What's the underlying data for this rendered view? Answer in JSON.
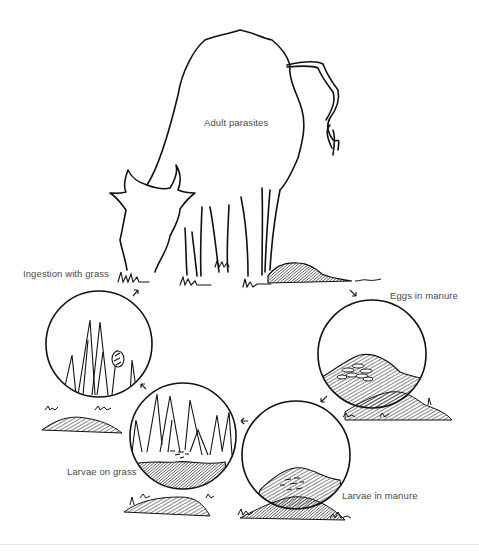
{
  "diagram": {
    "labels": {
      "adult": "Adult parasites",
      "ingestion": "Ingestion with grass",
      "eggs": "Eggs in manure",
      "larvae_manure": "Larvae in manure",
      "larvae_grass": "Larvae on grass"
    },
    "stages": [
      {
        "id": "adult",
        "label": "Adult parasites",
        "location": "inside cow"
      },
      {
        "id": "eggs",
        "label": "Eggs in manure",
        "location": "manure pat"
      },
      {
        "id": "larvae_manure",
        "label": "Larvae in manure",
        "location": "manure pat"
      },
      {
        "id": "larvae_grass",
        "label": "Larvae on grass",
        "location": "pasture grass"
      },
      {
        "id": "ingestion",
        "label": "Ingestion with grass",
        "location": "grazing cow"
      }
    ],
    "cycle_order": [
      "adult",
      "eggs",
      "larvae_manure",
      "larvae_grass",
      "ingestion",
      "adult"
    ],
    "colors": {
      "ink": "#111111",
      "label": "#4a4a4a",
      "background": "#ffffff",
      "rule": "#e6e6e6"
    }
  }
}
